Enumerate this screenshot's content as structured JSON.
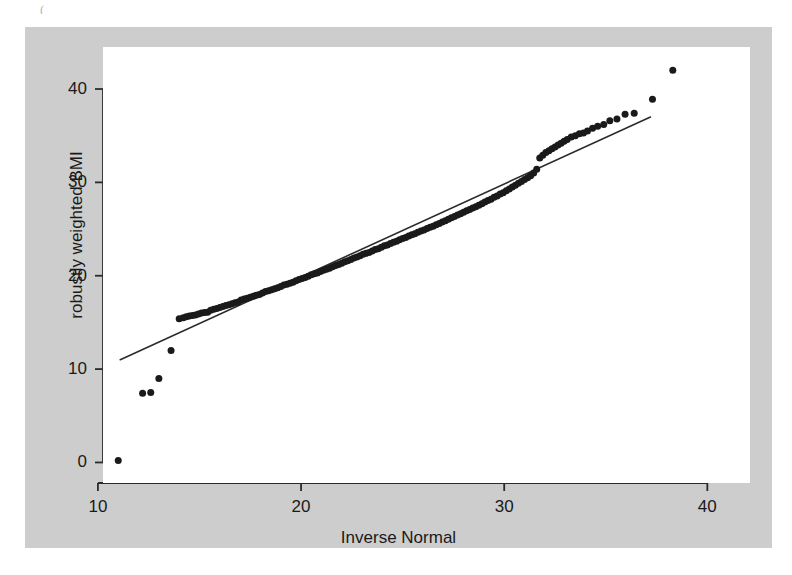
{
  "figure": {
    "background_color": "#cdcdcd",
    "plot_background_color": "#ffffff",
    "page_background_color": "#ffffff",
    "axis_color": "#2b2b2b",
    "marker_color": "#1a1a1a",
    "line_color": "#2b2b2b",
    "top_artifact": "("
  },
  "chart_data": {
    "type": "scatter",
    "title": "",
    "xlabel": "Inverse Normal",
    "ylabel": "robustly weighted BMI",
    "xlim": [
      10.25,
      42.1
    ],
    "ylim": [
      -2.2,
      44.5
    ],
    "xticks": [
      10,
      20,
      30,
      40
    ],
    "xtick_labels": [
      "10",
      "20",
      "30",
      "40"
    ],
    "yticks": [
      0,
      10,
      20,
      30,
      40
    ],
    "ytick_labels": [
      "0",
      "10",
      "20",
      "30",
      "40"
    ],
    "grid": false,
    "legend": null,
    "marker_shape": "filled-circle",
    "marker_size_px": 7,
    "reference_line": {
      "label": "y = x reference line",
      "x": [
        11.1,
        37.2
      ],
      "y": [
        11.0,
        37.0
      ]
    },
    "x": [
      11.0,
      12.2,
      12.6,
      13.0,
      13.6,
      14.0,
      14.2,
      14.35,
      14.5,
      14.65,
      14.8,
      14.95,
      15.1,
      15.25,
      15.4,
      15.55,
      15.7,
      15.85,
      16.0,
      16.15,
      16.3,
      16.45,
      16.6,
      16.75,
      16.9,
      17.05,
      17.2,
      17.35,
      17.5,
      17.65,
      17.8,
      17.95,
      18.1,
      18.25,
      18.4,
      18.55,
      18.7,
      18.85,
      19.0,
      19.15,
      19.3,
      19.45,
      19.6,
      19.75,
      19.9,
      20.05,
      20.2,
      20.35,
      20.5,
      20.65,
      20.8,
      20.95,
      21.1,
      21.25,
      21.4,
      21.55,
      21.7,
      21.85,
      22.0,
      22.15,
      22.3,
      22.45,
      22.6,
      22.75,
      22.9,
      23.05,
      23.2,
      23.35,
      23.5,
      23.65,
      23.8,
      23.95,
      24.1,
      24.25,
      24.4,
      24.55,
      24.7,
      24.85,
      25.0,
      25.15,
      25.3,
      25.45,
      25.6,
      25.75,
      25.9,
      26.05,
      26.2,
      26.35,
      26.5,
      26.65,
      26.8,
      26.95,
      27.1,
      27.25,
      27.4,
      27.55,
      27.7,
      27.85,
      28.0,
      28.15,
      28.3,
      28.45,
      28.6,
      28.75,
      28.9,
      29.05,
      29.2,
      29.35,
      29.5,
      29.65,
      29.8,
      29.95,
      30.1,
      30.25,
      30.4,
      30.55,
      30.7,
      30.85,
      31.0,
      31.15,
      31.3,
      31.45,
      31.6,
      31.75,
      31.9,
      32.05,
      32.2,
      32.35,
      32.5,
      32.65,
      32.8,
      32.95,
      33.1,
      33.3,
      33.5,
      33.7,
      33.9,
      34.1,
      34.35,
      34.6,
      34.9,
      35.2,
      35.55,
      35.95,
      36.4,
      37.3,
      38.3
    ],
    "y": [
      0.2,
      7.4,
      7.5,
      9.0,
      12.0,
      15.4,
      15.5,
      15.6,
      15.7,
      15.75,
      15.8,
      15.9,
      16.0,
      16.05,
      16.1,
      16.3,
      16.4,
      16.5,
      16.6,
      16.7,
      16.8,
      16.9,
      17.0,
      17.1,
      17.2,
      17.4,
      17.5,
      17.6,
      17.7,
      17.8,
      17.9,
      18.0,
      18.15,
      18.3,
      18.4,
      18.5,
      18.6,
      18.7,
      18.85,
      19.0,
      19.1,
      19.2,
      19.3,
      19.45,
      19.6,
      19.7,
      19.8,
      19.95,
      20.1,
      20.2,
      20.3,
      20.45,
      20.6,
      20.7,
      20.8,
      20.95,
      21.1,
      21.2,
      21.35,
      21.5,
      21.6,
      21.75,
      21.9,
      22.0,
      22.15,
      22.3,
      22.4,
      22.5,
      22.65,
      22.8,
      22.9,
      23.05,
      23.2,
      23.3,
      23.45,
      23.6,
      23.7,
      23.85,
      24.0,
      24.1,
      24.25,
      24.4,
      24.5,
      24.65,
      24.8,
      24.9,
      25.05,
      25.2,
      25.3,
      25.45,
      25.6,
      25.75,
      25.9,
      26.05,
      26.2,
      26.35,
      26.5,
      26.65,
      26.8,
      26.95,
      27.1,
      27.25,
      27.4,
      27.55,
      27.7,
      27.9,
      28.05,
      28.2,
      28.4,
      28.55,
      28.75,
      28.9,
      29.1,
      29.3,
      29.5,
      29.7,
      29.9,
      30.1,
      30.3,
      30.5,
      30.7,
      31.0,
      31.4,
      32.6,
      32.9,
      33.2,
      33.4,
      33.6,
      33.8,
      34.0,
      34.2,
      34.4,
      34.6,
      34.85,
      35.0,
      35.2,
      35.3,
      35.5,
      35.8,
      36.0,
      36.2,
      36.6,
      36.8,
      37.3,
      37.4,
      38.9,
      42.0
    ]
  }
}
